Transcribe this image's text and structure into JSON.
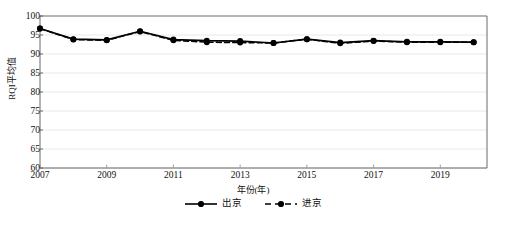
{
  "chart_data": {
    "type": "line",
    "title": "",
    "xlabel": "年份(年)",
    "ylabel": "RQI平均值",
    "xlim": [
      2007,
      2020.4
    ],
    "ylim": [
      60,
      100
    ],
    "yticks": [
      60,
      65,
      70,
      75,
      80,
      85,
      90,
      95,
      100
    ],
    "xticks": [
      2007,
      2009,
      2011,
      2013,
      2015,
      2017,
      2019
    ],
    "grid": "horizontal",
    "legend_position": "below",
    "x": [
      2007,
      2008,
      2009,
      2010,
      2011,
      2012,
      2013,
      2014,
      2015,
      2016,
      2017,
      2018,
      2019,
      2020
    ],
    "series": [
      {
        "name": "出京",
        "style": "solid",
        "marker": "filled-circle",
        "color": "#000000",
        "values": [
          96.7,
          93.9,
          93.7,
          96.0,
          93.8,
          93.5,
          93.4,
          92.9,
          93.9,
          93.0,
          93.5,
          93.2,
          93.2,
          93.1
        ]
      },
      {
        "name": "进京",
        "style": "dashed",
        "marker": "filled-circle",
        "color": "#000000",
        "values": [
          96.7,
          93.8,
          93.6,
          95.9,
          93.6,
          93.1,
          93.0,
          92.9,
          93.9,
          92.8,
          93.4,
          93.1,
          93.1,
          93.1
        ]
      }
    ]
  },
  "axis": {
    "ylabel": "RQI平均值",
    "xlabel": "年份(年)"
  },
  "legend": {
    "items": [
      {
        "label": "出京"
      },
      {
        "label": "进京"
      }
    ]
  }
}
